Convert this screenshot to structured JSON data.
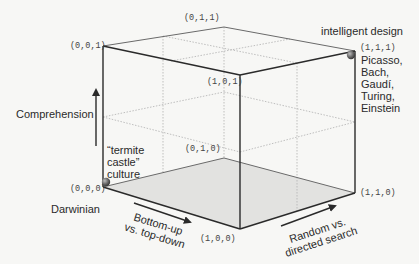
{
  "diagram": {
    "type": "3d-cube-design-space",
    "colors": {
      "background": "#f7f7f5",
      "edge_dark": "#2a2a2a",
      "edge_light": "#6a6a6a",
      "hidden_dotted": "#b8b8b8",
      "floor_fill": "#e2e2e0",
      "sphere": "#666666"
    },
    "vertices": [
      {
        "id": "v000",
        "label": "(0,0,0)"
      },
      {
        "id": "v100",
        "label": "(1,0,0)"
      },
      {
        "id": "v110",
        "label": "(1,1,0)"
      },
      {
        "id": "v010",
        "label": "(0,1,0)"
      },
      {
        "id": "v001",
        "label": "(0,0,1)"
      },
      {
        "id": "v101",
        "label": "(1,0,1)"
      },
      {
        "id": "v111",
        "label": "(1,1,1)"
      },
      {
        "id": "v011",
        "label": "(0,1,1)"
      }
    ],
    "axes": {
      "vertical": {
        "label": "Comprehension"
      },
      "front": {
        "label": "Bottom-up\nvs. top-down"
      },
      "side": {
        "label": "Random vs.\ndirected search"
      }
    },
    "annotations": {
      "origin_name": "Darwinian",
      "origin_note": "“termite\ncastle”\nculture",
      "top_name": "intelligent design",
      "top_note": "Picasso,\nBach,\nGaudí,\nTuring,\nEinstein"
    },
    "points": [
      {
        "at": "(0,0,0)",
        "marker": "sphere"
      },
      {
        "at": "(1,1,1)",
        "marker": "sphere"
      }
    ]
  }
}
